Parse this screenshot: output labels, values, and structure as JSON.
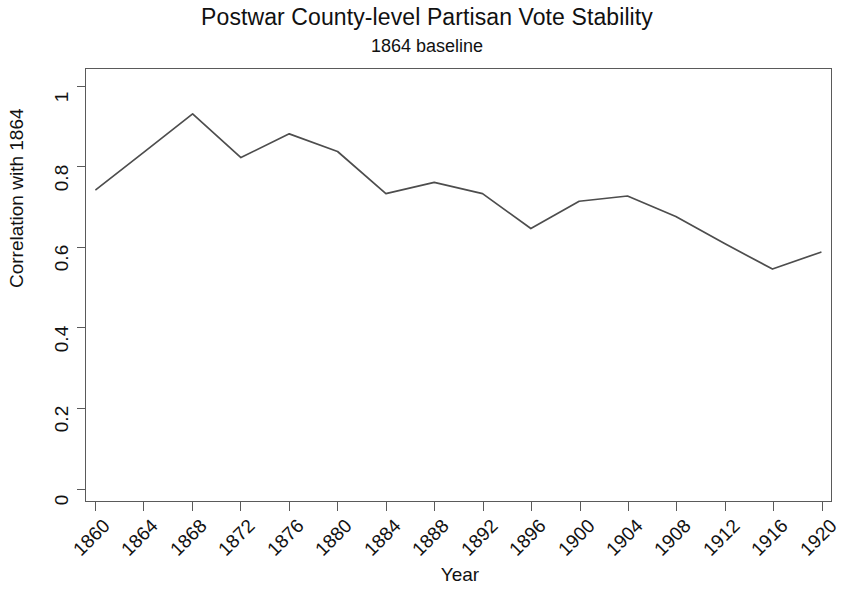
{
  "chart_data": {
    "type": "line",
    "title": "Postwar County-level Partisan Vote Stability",
    "subtitle": "1864 baseline",
    "xlabel": "Year",
    "ylabel": "Correlation with 1864",
    "categories": [
      1860,
      1864,
      1868,
      1872,
      1876,
      1880,
      1884,
      1888,
      1892,
      1896,
      1900,
      1904,
      1908,
      1912,
      1916,
      1920
    ],
    "x_tick_labels": [
      "1860",
      "1864",
      "1868",
      "1872",
      "1876",
      "1880",
      "1884",
      "1888",
      "1892",
      "1896",
      "1900",
      "1904",
      "1908",
      "1912",
      "1916",
      "1920"
    ],
    "values": [
      0.744,
      0.838,
      0.933,
      0.824,
      0.883,
      0.839,
      0.734,
      0.762,
      0.734,
      0.647,
      0.715,
      0.728,
      0.677,
      0.61,
      0.546,
      0.588
    ],
    "y_tick_labels": [
      "1",
      "0.8",
      "0.6",
      "0.4",
      "0.2",
      "0"
    ],
    "y_tick_values": [
      1,
      0.8,
      0.6,
      0.4,
      0.2,
      0
    ],
    "xlim": [
      1858,
      1922
    ],
    "ylim": [
      0,
      1.06
    ],
    "grid": false,
    "legend": false,
    "series_color": "#4d4d4d",
    "axis_color": "#5a5a5a",
    "background_color": "#ffffff"
  }
}
